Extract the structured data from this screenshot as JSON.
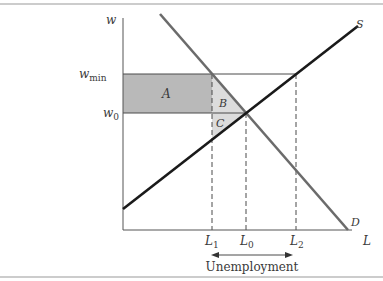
{
  "diagram": {
    "type": "minimum-wage labor market",
    "axes": {
      "y_label": "w",
      "x_label": "L"
    },
    "price_levels": {
      "w_min": {
        "label_main": "w",
        "label_sub": "min"
      },
      "w_0": {
        "label_main": "w",
        "label_sub": "0"
      }
    },
    "quantity_levels": {
      "L_1": {
        "label_main": "L",
        "label_sub": "1"
      },
      "L_0": {
        "label_main": "L",
        "label_sub": "0"
      },
      "L_2": {
        "label_main": "L",
        "label_sub": "2"
      }
    },
    "curves": {
      "supply": {
        "label": "S",
        "color": "#1a1a1a"
      },
      "demand": {
        "label": "D",
        "color": "#6b6b6b"
      }
    },
    "regions": {
      "A": {
        "label": "A",
        "color": "#b9b9b9"
      },
      "B": {
        "label": "B",
        "color": "#dadada"
      },
      "C": {
        "label": "C",
        "color": "#dadada"
      }
    },
    "annotation": {
      "unemployment_label": "Unemployment"
    }
  }
}
